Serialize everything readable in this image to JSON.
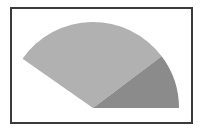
{
  "diagram": {
    "type": "sector",
    "center": [
      93,
      108
    ],
    "radius": 86,
    "regions": [
      {
        "name": "large-region",
        "start_angle_deg": 37,
        "end_angle_deg": 145,
        "color": "#b1b1b1"
      },
      {
        "name": "small-region",
        "start_angle_deg": 0,
        "end_angle_deg": 37,
        "color": "#8b8b8b"
      }
    ],
    "frame_color": "#3a3a3a"
  }
}
